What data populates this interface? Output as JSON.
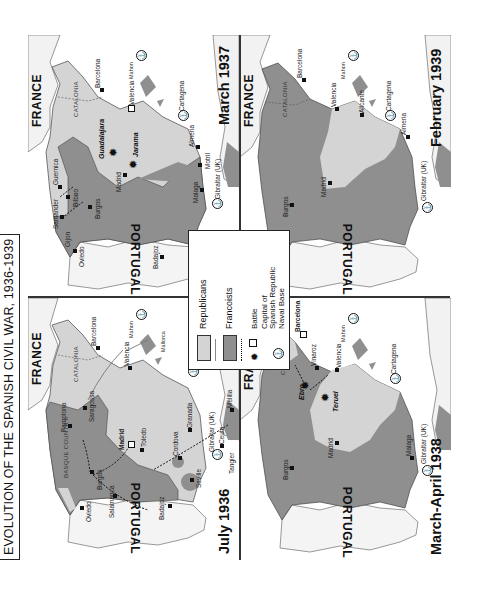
{
  "title": "EVOLUTION OF THE SPANISH CIVIL WAR, 1936-1939",
  "colors": {
    "republicans": "#d4d4d4",
    "francoists": "#8f8f8f",
    "sea": "#ffffff",
    "foreign_land": "#f0f0f0",
    "border": "#222222"
  },
  "legend": {
    "items": [
      {
        "symbol": "light-gray-swatch + gray arrow",
        "label": "Republicans"
      },
      {
        "symbol": "dark-gray-swatch + dotted arrow",
        "label": "Francoists"
      },
      {
        "symbol": "battle-icon",
        "label": "Battle"
      },
      {
        "symbol": "hollow-square",
        "label": "Capital of Spanish Republic"
      },
      {
        "symbol": "anchor-circle",
        "label": "Naval Base"
      }
    ],
    "republicans": "Republicans",
    "francoists": "Francoists",
    "battle": "Battle",
    "capital_line1": "Capital of",
    "capital_line2": "Spanish Republic",
    "naval_line1": "Naval Base"
  },
  "panels": [
    {
      "id": "july-1936",
      "period": "July 1936",
      "countries": {
        "france": "FRANCE",
        "portugal": "PORTUGAL"
      },
      "regions": [
        "BASQUE COUNTRY",
        "CATALONIA"
      ],
      "cities": [
        "Oviedo",
        "Pamplona",
        "Burgos",
        "Salamanca",
        "Saragossa",
        "Barcelona",
        "Madrid",
        "Toledo",
        "Badajoz",
        "Valencia",
        "Mallorca",
        "Mahon",
        "Cordova",
        "Seville",
        "Granada",
        "Cartagena",
        "Gibraltar (UK)",
        "Ceuta",
        "Tangier",
        "Melilla"
      ],
      "capital": "Madrid",
      "naval_bases": [
        "Mahon",
        "Cartagena",
        "Gibraltar (UK)"
      ]
    },
    {
      "id": "march-1937",
      "period": "March 1937",
      "countries": {
        "france": "FRANCE",
        "portugal": "PORTUGAL"
      },
      "regions": [
        "CATALONIA"
      ],
      "cities": [
        "Oviedo",
        "Gijon",
        "Santander",
        "Guernica",
        "Bilbao",
        "Burgos",
        "Madrid",
        "Guadalajara",
        "Jarama",
        "Badajoz",
        "Barcelona",
        "Valencia",
        "Mahon",
        "Cartagena",
        "Almeria",
        "Motril",
        "Malaga",
        "Gibraltar (UK)"
      ],
      "battles": [
        "Guadalajara",
        "Jarama"
      ],
      "capital": "Valencia",
      "naval_bases": [
        "Mahon",
        "Cartagena",
        "Gibraltar (UK)"
      ]
    },
    {
      "id": "march-april-1938",
      "period": "March-April 1938",
      "countries": {
        "france": "FRANCE",
        "portugal": "PORTUGAL"
      },
      "regions": [
        "CATALONIA"
      ],
      "cities": [
        "Burgos",
        "Madrid",
        "Barcelona",
        "Vinaroz",
        "Valencia",
        "Ebro",
        "Teruel",
        "Mahon",
        "Cartagena",
        "Malaga",
        "Gibraltar (UK)"
      ],
      "battles": [
        "Ebro",
        "Teruel"
      ],
      "capital": "Barcelona",
      "naval_bases": [
        "Mahon",
        "Cartagena",
        "Gibraltar (UK)"
      ]
    },
    {
      "id": "february-1939",
      "period": "February 1939",
      "countries": {
        "france": "FRANCE",
        "portugal": "PORTUGAL"
      },
      "regions": [
        "CATALONIA"
      ],
      "cities": [
        "Burgos",
        "Madrid",
        "Barcelona",
        "Valencia",
        "Alicante",
        "Cartagena",
        "Almeria",
        "Mahon",
        "Gibraltar (UK)"
      ],
      "naval_bases": [
        "Mahon",
        "Cartagena",
        "Gibraltar (UK)"
      ]
    }
  ]
}
